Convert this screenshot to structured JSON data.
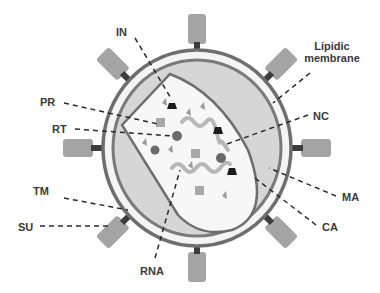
{
  "diagram": {
    "colors": {
      "membrane": "#6e6e6e",
      "matrix_fill": "#f4f4f4",
      "capsid_shell_fill": "#d6d6d6",
      "capsid_core_fill": "#f7f7f7",
      "spike_su": "#a4a4a4",
      "spike_tm": "#3c3c3c",
      "rna": "#b8b8b8",
      "enzyme_dark": "#1c1c1c",
      "enzyme_mid": "#6a6a6a",
      "enzyme_light": "#a8a8a8"
    },
    "labels": {
      "in": "IN",
      "pr": "PR",
      "rt": "RT",
      "tm": "TM",
      "su": "SU",
      "rna": "RNA",
      "lipidic_line1": "Lipidic",
      "lipidic_line2": "membrane",
      "nc": "NC",
      "ma": "MA",
      "ca": "CA"
    }
  }
}
